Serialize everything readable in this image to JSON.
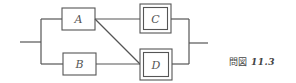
{
  "diagram": {
    "type": "reliability-block-diagram",
    "blocks": [
      {
        "id": "A",
        "label": "A",
        "style": "single"
      },
      {
        "id": "B",
        "label": "B",
        "style": "single"
      },
      {
        "id": "C",
        "label": "C",
        "style": "double"
      },
      {
        "id": "D",
        "label": "D",
        "style": "double"
      }
    ],
    "connections": [
      {
        "from": "input",
        "to": "A"
      },
      {
        "from": "input",
        "to": "B"
      },
      {
        "from": "A",
        "to": "C"
      },
      {
        "from": "A",
        "to": "D"
      },
      {
        "from": "B",
        "to": "D"
      },
      {
        "from": "C",
        "to": "output"
      },
      {
        "from": "D",
        "to": "output"
      }
    ]
  },
  "caption": {
    "prefix": "問図",
    "number": "11.3"
  }
}
